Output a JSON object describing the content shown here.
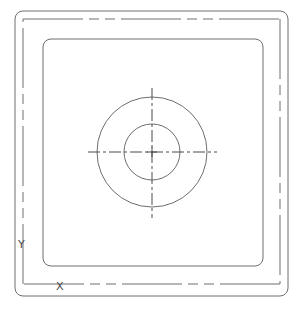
{
  "drawing": {
    "type": "cad-plan-view",
    "background": "#ffffff",
    "line_color": "#6e6e6e",
    "outer_rounded_rect": {
      "x": 15,
      "y": 11,
      "w": 273,
      "h": 285,
      "rx": 8
    },
    "dashed_rect": {
      "x": 23,
      "y": 19,
      "w": 257,
      "h": 265
    },
    "inner_rounded_rect": {
      "x": 43,
      "y": 39,
      "w": 220,
      "h": 227,
      "rx": 8
    },
    "circles": {
      "center": {
        "x": 152,
        "y": 152
      },
      "outer_radius": 55,
      "inner_radius": 28
    },
    "centerlines": {
      "horizontal": {
        "x1": 88,
        "x2": 217,
        "y": 152
      },
      "vertical": {
        "x": 152,
        "y1": 88,
        "y2": 218
      }
    },
    "axis_indicator": {
      "origin": {
        "x": 23,
        "y": 284
      },
      "y_label": "Y",
      "x_label": "X",
      "y_label_pos": {
        "x": 22,
        "y": 248
      },
      "x_label_pos": {
        "x": 60,
        "y": 286
      }
    }
  }
}
